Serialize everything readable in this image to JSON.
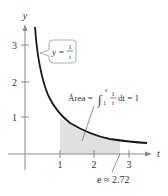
{
  "figure": {
    "axes": {
      "x_label": "t",
      "y_label": "y",
      "x_ticks": [
        "1",
        "2",
        "3"
      ],
      "y_ticks": [
        "1",
        "2",
        "3"
      ]
    },
    "curve_label": {
      "lhs": "y =",
      "num": "1",
      "den": "t"
    },
    "area_label": {
      "prefix": "Área =",
      "integral_upper": "e",
      "integral_lower": "1",
      "frac_num": "1",
      "frac_den": "t",
      "suffix": "dt = 1"
    },
    "e_label": {
      "text": "e ≈ 2.72",
      "value": 2.72
    },
    "colors": {
      "curve": "#1a1a1a",
      "axis": "#8a8a8a",
      "shade": "#e0e0e0",
      "text": "#333333"
    }
  }
}
